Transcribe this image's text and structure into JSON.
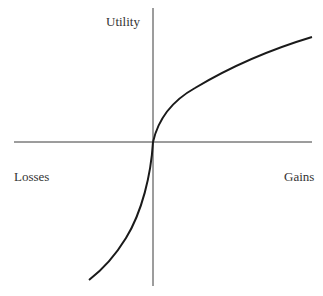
{
  "diagram": {
    "labels": {
      "y_axis": "Utility",
      "x_negative": "Losses",
      "x_positive": "Gains"
    },
    "colors": {
      "axis": "#3a3a3a",
      "curve": "#1a1a1a",
      "text": "#333333",
      "background": "#ffffff"
    },
    "geometry": {
      "origin": [
        153,
        142
      ],
      "x_axis": [
        14,
        312
      ],
      "y_axis": [
        8,
        286
      ],
      "curve_gain_end": [
        312,
        37
      ],
      "curve_loss_end": [
        89,
        280
      ]
    }
  }
}
